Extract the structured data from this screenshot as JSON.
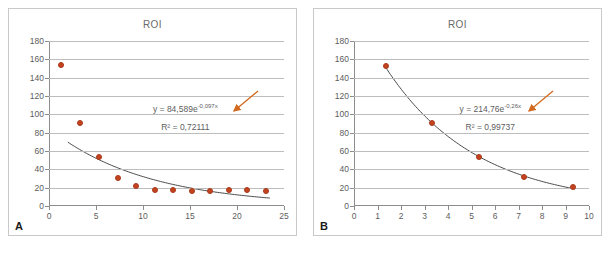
{
  "figure": {
    "background": "#ffffff",
    "marker_color": "#c4431f",
    "curve_color": "#4a4a4a",
    "grid_color": "#bdbdbd",
    "arrow_color": "#d2691e",
    "text_color": "#5d5d5d"
  },
  "panels": [
    {
      "letter": "A",
      "title": "ROI",
      "equation_prefix": "y = 84,589e",
      "equation_exponent": "-0,097x",
      "r2_text": "R² = 0,72111",
      "chart_data": {
        "type": "scatter",
        "title": "ROI",
        "xlabel": "",
        "ylabel": "",
        "xlim": [
          0,
          25
        ],
        "ylim": [
          0,
          180
        ],
        "xticks": [
          0,
          5,
          10,
          15,
          20,
          25
        ],
        "yticks": [
          0,
          20,
          40,
          60,
          80,
          100,
          120,
          140,
          160,
          180
        ],
        "grid": true,
        "legend": "none",
        "series": [
          {
            "name": "ROI observations",
            "marker": "circle",
            "color": "#c4431f",
            "x": [
              1.3,
              3.3,
              5.3,
              7.3,
              9.3,
              11.3,
              13.2,
              15.2,
              17.1,
              19.1,
              21.1,
              23.1
            ],
            "y": [
              154,
              91,
              54,
              31,
              22,
              17,
              17,
              16.5,
              16.5,
              17.5,
              18,
              16
            ]
          }
        ],
        "trendline": {
          "type": "exponential",
          "equation": "y = 84,589e^(-0,097x)",
          "a": 84.589,
          "b": -0.097,
          "r2": 0.72111,
          "color": "#4a4a4a",
          "x_start": 2.0,
          "x_end": 23.5
        },
        "annotations": [
          {
            "name": "equation-arrow",
            "type": "arrow",
            "color": "#d2691e",
            "points_to": "equation-label"
          }
        ]
      }
    },
    {
      "letter": "B",
      "title": "ROI",
      "equation_prefix": "y = 214,76e",
      "equation_exponent": "-0,26x",
      "r2_text": "R² = 0,99737",
      "chart_data": {
        "type": "scatter",
        "title": "ROI",
        "xlabel": "",
        "ylabel": "",
        "xlim": [
          0,
          10
        ],
        "ylim": [
          0,
          180
        ],
        "xticks": [
          0,
          1,
          2,
          3,
          4,
          5,
          6,
          7,
          8,
          9,
          10
        ],
        "yticks": [
          0,
          20,
          40,
          60,
          80,
          100,
          120,
          140,
          160,
          180
        ],
        "grid": true,
        "legend": "none",
        "series": [
          {
            "name": "ROI observations",
            "marker": "circle",
            "color": "#c4431f",
            "x": [
              1.35,
              3.3,
              5.3,
              7.25,
              9.3
            ],
            "y": [
              153,
              91,
              54,
              32,
              21
            ]
          }
        ],
        "trendline": {
          "type": "exponential",
          "equation": "y = 214,76e^(-0,26x)",
          "a": 214.76,
          "b": -0.26,
          "r2": 0.99737,
          "color": "#4a4a4a",
          "x_start": 1.35,
          "x_end": 9.4
        },
        "annotations": [
          {
            "name": "equation-arrow",
            "type": "arrow",
            "color": "#d2691e",
            "points_to": "equation-label"
          }
        ]
      }
    }
  ]
}
